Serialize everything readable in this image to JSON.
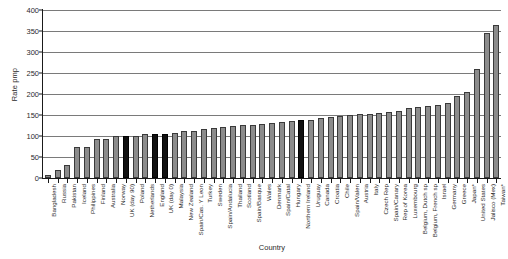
{
  "chart_data": {
    "type": "bar",
    "title": "",
    "xlabel": "Country",
    "ylabel": "Rate pmp",
    "ylim": [
      0,
      400
    ],
    "yticks": [
      0,
      50,
      100,
      150,
      200,
      250,
      300,
      350,
      400
    ],
    "grid": true,
    "legend": "none",
    "bar_color": "#8c8c8c",
    "highlight_color": "#101010",
    "highlighted": [
      "UK (day 90)",
      "England",
      "UK (day 0)",
      "Northern Ireland"
    ],
    "categories": [
      "Bangladesh",
      "Russia",
      "Pakistan",
      "Iceland",
      "Philippines",
      "Finland",
      "Australia",
      "Norway",
      "UK (day 90)",
      "Poland",
      "Netherlands",
      "England",
      "UK (day 0)",
      "Malaysia",
      "New Zealand",
      "Spain/Cas. Y Leon",
      "Turkey",
      "Sweden",
      "Spain/Andalucia",
      "Thailand",
      "Scotland",
      "Spain/Basque",
      "Wales",
      "Denmark",
      "Spain/Catal",
      "Hungary",
      "Northern Ireland",
      "Uruguay",
      "Canada",
      "Croatia",
      "Chile",
      "Spain/Valen",
      "Austria",
      "Italy",
      "Czech Rep",
      "Spain/Canary",
      "Rep of Korea",
      "Luxembourg",
      "Belgium, Dutch sp",
      "Belgium, French sp",
      "Israel",
      "Germany",
      "Greece",
      "Japan*",
      "United States",
      "Jalisco (Mex)",
      "Taiwan*"
    ],
    "values": [
      8,
      18,
      32,
      75,
      75,
      93,
      93,
      99,
      100,
      101,
      104,
      105,
      105,
      108,
      112,
      113,
      117,
      119,
      122,
      124,
      126,
      127,
      129,
      131,
      133,
      135,
      137,
      138,
      143,
      146,
      148,
      150,
      152,
      153,
      155,
      158,
      160,
      166,
      170,
      172,
      174,
      178,
      195,
      205,
      260,
      345,
      365
    ]
  }
}
